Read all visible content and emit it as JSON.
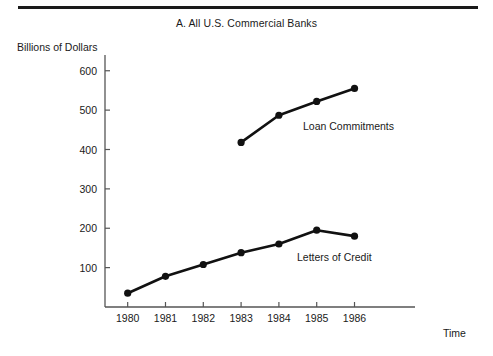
{
  "page": {
    "background_color": "#ffffff",
    "ink_color": "#1a1a1a"
  },
  "figure": {
    "title": "A. All U.S. Commercial Banks",
    "y_axis_label": "Billions of Dollars",
    "x_axis_label": "Time"
  },
  "series_labels": {
    "loan_commitments": "Loan Commitments",
    "letters_of_credit": "Letters of Credit"
  },
  "chart_data": {
    "type": "line",
    "title": "A. All U.S. Commercial Banks",
    "xlabel": "Time",
    "ylabel": "Billions of Dollars",
    "categories": [
      "1980",
      "1981",
      "1982",
      "1983",
      "1984",
      "1985",
      "1986"
    ],
    "x": [
      1980,
      1981,
      1982,
      1983,
      1984,
      1985,
      1986
    ],
    "ylim": [
      0,
      640
    ],
    "xlim": [
      1979.4,
      1987.6
    ],
    "yticks": [
      100,
      200,
      300,
      400,
      500,
      600
    ],
    "ytick_labels": [
      "100",
      "200",
      "300",
      "400",
      "500",
      "600"
    ],
    "xticks": [
      1980,
      1981,
      1982,
      1983,
      1984,
      1985,
      1986
    ],
    "xtick_labels": [
      "1980",
      "1981",
      "1982",
      "1983",
      "1984",
      "1985",
      "1986"
    ],
    "grid": false,
    "legend": "inline-annotations",
    "marker": "filled-circle",
    "line_color": "#111111",
    "series": [
      {
        "name": "Loan Commitments",
        "x": [
          1983,
          1984,
          1985,
          1986
        ],
        "values": [
          418,
          487,
          522,
          555
        ],
        "label_position": "right-of-1984-point"
      },
      {
        "name": "Letters of Credit",
        "x": [
          1980,
          1981,
          1982,
          1983,
          1984,
          1985,
          1986
        ],
        "values": [
          35,
          78,
          108,
          138,
          160,
          195,
          180
        ],
        "label_position": "below-right-of-1984-point"
      }
    ]
  }
}
